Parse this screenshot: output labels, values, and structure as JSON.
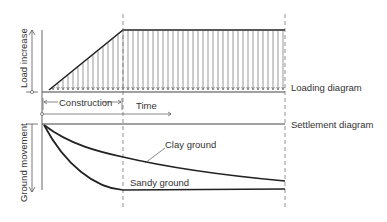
{
  "diagram": {
    "labels": {
      "y_axis_top": "Load increase",
      "y_axis_bottom": "Ground movement",
      "construction": "Construction",
      "time": "Time",
      "loading_diagram": "Loading diagram",
      "settlement_diagram": "Settlement diagram",
      "clay_ground": "Clay ground",
      "sandy_ground": "Sandy ground"
    },
    "colors": {
      "line": "#2a2a2a",
      "thin": "#555555",
      "text": "#333333",
      "background": "#ffffff"
    },
    "geometry": {
      "left_axis_x": 42,
      "construction_end_x": 123,
      "end_x": 285,
      "load_baseline_y": 92,
      "load_top_y": 30,
      "load_start_x": 49,
      "settlement_baseline_y": 124,
      "arrow_spacing": 5
    }
  }
}
